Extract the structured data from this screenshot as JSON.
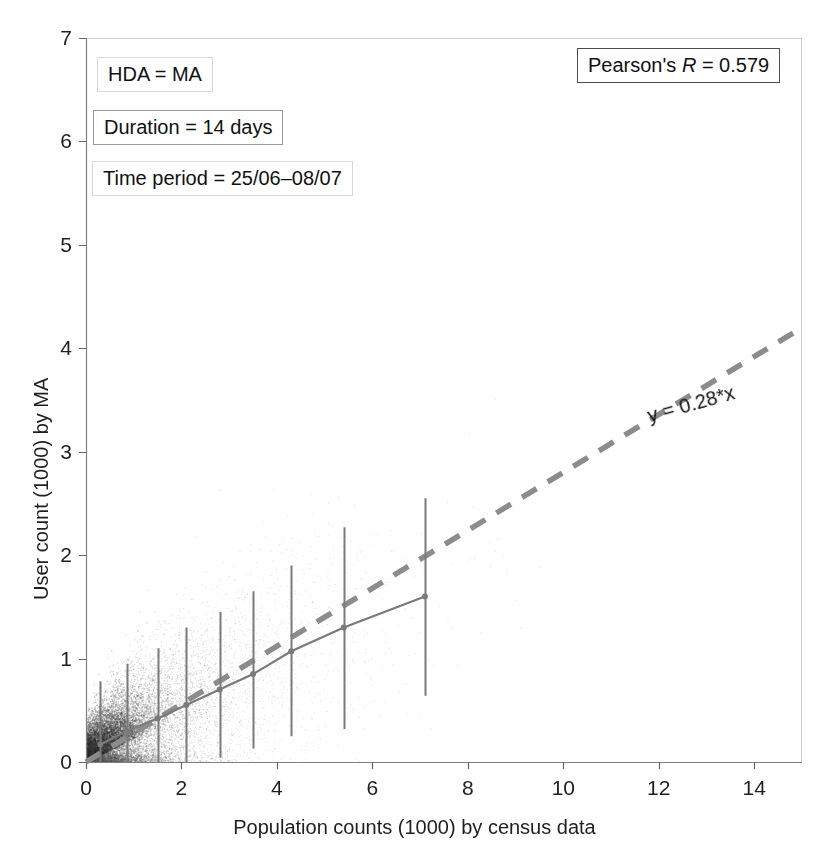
{
  "chart_data": {
    "type": "scatter",
    "title": "",
    "xlabel": "Population counts (1000) by census data",
    "ylabel": "User count (1000) by MA",
    "xlim": [
      0,
      15.0
    ],
    "ylim": [
      0,
      7
    ],
    "xticks": [
      0,
      2,
      4,
      6,
      8,
      10,
      12,
      14
    ],
    "yticks": [
      0,
      1,
      2,
      3,
      4,
      5,
      6,
      7
    ],
    "xtick_labels": [
      "0",
      "2",
      "4",
      "6",
      "8",
      "10",
      "12",
      "14"
    ],
    "ytick_labels": [
      "0",
      "1",
      "2",
      "3",
      "4",
      "5",
      "6",
      "7"
    ],
    "grid": false,
    "legend_position": "none",
    "scatter_description": "dense grey point cloud of ~40000 points concentrated near the origin, spreading along a positive linear trend",
    "scatter_color": "#808080",
    "regression_line": {
      "label": "y = 0.28*x",
      "slope": 0.28,
      "intercept": 0,
      "style": "dashed",
      "color": "#8c8c8c",
      "x_start": 0,
      "x_end": 15.0,
      "y_start": 0,
      "y_end": 4.2
    },
    "binned_mean_series": {
      "name": "binned mean with standard deviation",
      "color": "#7a7a7a",
      "x": [
        0.3,
        0.85,
        1.5,
        2.1,
        2.8,
        3.5,
        4.3,
        5.4,
        7.1
      ],
      "y": [
        0.17,
        0.3,
        0.42,
        0.55,
        0.7,
        0.85,
        1.07,
        1.3,
        1.6
      ],
      "err_low": [
        0.0,
        0.0,
        0.0,
        0.0,
        0.04,
        0.13,
        0.25,
        0.32,
        0.64
      ],
      "err_high": [
        0.78,
        0.95,
        1.1,
        1.3,
        1.45,
        1.65,
        1.9,
        2.27,
        2.55
      ]
    },
    "annotations": [
      {
        "id": "hda",
        "text": "HDA = MA",
        "border": "faint"
      },
      {
        "id": "duration",
        "text": "Duration = 14 days",
        "border": "mid"
      },
      {
        "id": "time_period",
        "text": "Time period = 25/06–08/07",
        "border": "faint"
      }
    ],
    "pearson": {
      "prefix": "Pearson's ",
      "symbol": "R",
      "value": " = 0.579"
    }
  },
  "axes": {
    "x_title": "Population counts (1000) by census data",
    "y_title": "User count (1000) by MA"
  },
  "annotations": {
    "hda": "HDA = MA",
    "duration": "Duration = 14 days",
    "time_period": "Time period = 25/06–08/07",
    "equation": "y = 0.28*x",
    "pearson_prefix": "Pearson's ",
    "pearson_symbol": "R",
    "pearson_value": " = 0.579"
  }
}
